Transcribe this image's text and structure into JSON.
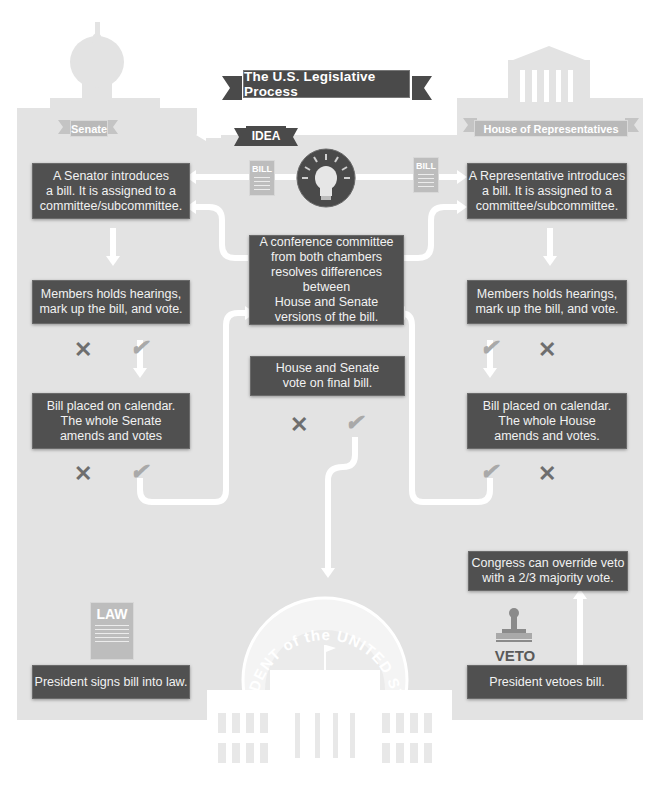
{
  "title": "The U.S. Legislative Process",
  "chambers": {
    "senate": "Senate",
    "house": "House of Representatives"
  },
  "idea": "IDEA",
  "documents": {
    "bill_left": "BILL",
    "bill_right": "BILL",
    "law": "LAW",
    "veto": "VETO"
  },
  "senate_steps": {
    "introduce": "A Senator introduces\na bill. It is assigned to a\ncommittee/subcommittee.",
    "hearings": "Members holds hearings,\nmark up the bill, and vote.",
    "calendar": "Bill placed on calendar.\nThe whole Senate\namends and votes"
  },
  "house_steps": {
    "introduce": "A Representative introduces\na bill. It is assigned to a\ncommittee/subcommittee.",
    "hearings": "Members holds hearings,\nmark up the bill, and vote.",
    "calendar": "Bill placed on calendar.\nThe whole House\namends and votes."
  },
  "center_steps": {
    "conference": "A conference committee\nfrom both chambers\nresolves differences between\nHouse and Senate\nversions of the bill.",
    "final_vote": "House and Senate\nvote on final bill."
  },
  "president_steps": {
    "signs": "President signs bill into law.",
    "vetoes": "President vetoes bill.",
    "override": "Congress can override veto\nwith a 2/3 majority vote."
  },
  "seal_text": "PRESIDENT of the UNITED STATES",
  "marks": {
    "reject": "✕",
    "approve": "✔"
  },
  "colors": {
    "box": "#505050",
    "background_panel": "#e3e3e3",
    "connector": "#ffffff",
    "label_ribbon": "#b9b9b9",
    "approve": "#a9a9a9",
    "reject": "#6e6e6e"
  }
}
